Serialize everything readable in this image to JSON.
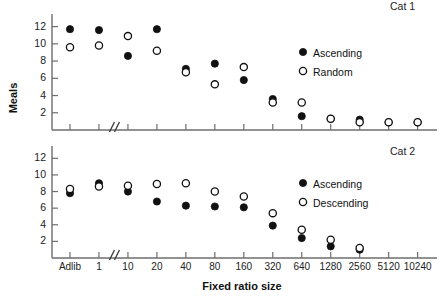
{
  "figure": {
    "xlabel": "Fixed ratio size",
    "ylabel": "Meals"
  },
  "panels": {
    "top": {
      "label": "Cat 1",
      "legend": [
        {
          "name": "legend-ascending",
          "label": "Ascending",
          "marker": "filled-circle"
        },
        {
          "name": "legend-random",
          "label": "Random",
          "marker": "open-circle"
        }
      ]
    },
    "bottom": {
      "label": "Cat 2",
      "legend": [
        {
          "name": "legend-ascending",
          "label": "Ascending",
          "marker": "filled-circle"
        },
        {
          "name": "legend-descending",
          "label": "Descending",
          "marker": "open-circle"
        }
      ]
    }
  },
  "chart_data": [
    {
      "type": "scatter",
      "title": "Cat 1",
      "xlabel": "Fixed ratio size",
      "ylabel": "Meals",
      "categories": [
        "Adlib",
        "1",
        "10",
        "20",
        "40",
        "80",
        "160",
        "320",
        "640",
        "1280",
        "2560",
        "5120",
        "10240"
      ],
      "axis_break_after": "1",
      "ylim": [
        0,
        13
      ],
      "yticks": [
        2,
        4,
        6,
        8,
        10,
        12
      ],
      "grid": false,
      "legend_position": "upper-right",
      "series": [
        {
          "name": "Ascending",
          "marker": "filled-circle",
          "values": [
            11.7,
            11.6,
            8.6,
            11.7,
            7.1,
            7.7,
            5.8,
            3.6,
            1.6,
            1.3,
            1.2,
            0.9,
            0.9
          ]
        },
        {
          "name": "Random",
          "marker": "open-circle",
          "values": [
            9.6,
            9.8,
            10.9,
            9.2,
            6.7,
            5.3,
            7.3,
            3.2,
            3.2,
            1.3,
            0.9,
            0.9,
            0.9
          ]
        }
      ]
    },
    {
      "type": "scatter",
      "title": "Cat 2",
      "xlabel": "Fixed ratio size",
      "ylabel": "Meals",
      "categories": [
        "Adlib",
        "1",
        "10",
        "20",
        "40",
        "80",
        "160",
        "320",
        "640",
        "1280",
        "2560",
        "5120",
        "10240"
      ],
      "axis_break_after": "1",
      "ylim": [
        0,
        13
      ],
      "yticks": [
        2,
        4,
        6,
        8,
        10,
        12
      ],
      "grid": false,
      "legend_position": "upper-right",
      "series": [
        {
          "name": "Ascending",
          "marker": "filled-circle",
          "values": [
            7.8,
            9.0,
            8.0,
            6.8,
            6.3,
            6.2,
            6.1,
            3.9,
            2.4,
            1.4,
            1.0,
            null,
            null
          ]
        },
        {
          "name": "Descending",
          "marker": "open-circle",
          "values": [
            8.3,
            8.6,
            8.7,
            8.9,
            9.0,
            8.0,
            7.4,
            5.4,
            3.4,
            2.2,
            1.2,
            null,
            null
          ]
        }
      ]
    }
  ],
  "yticks_top": [
    "12",
    "10",
    "8",
    "6",
    "4",
    "2"
  ],
  "yticks_bottom": [
    "12",
    "10",
    "8",
    "6",
    "4",
    "2"
  ],
  "xticks": [
    "Adlib",
    "1",
    "10",
    "20",
    "40",
    "80",
    "160",
    "320",
    "640",
    "1280",
    "2560",
    "5120",
    "10240"
  ]
}
